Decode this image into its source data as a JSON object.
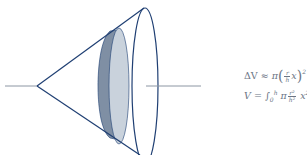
{
  "diagram": {
    "colors": {
      "outline": "#1f3f73",
      "axis": "#8c96a3",
      "disk_front": "#c9d2dc",
      "disk_side": "#7f8fa4",
      "text": "#6b7585"
    },
    "equations": {
      "slice": {
        "delta_v": "ΔV",
        "approx": "≈",
        "pi": "π",
        "lparen": "(",
        "frac_num": "r",
        "frac_den": "h",
        "var": "x",
        "rparen": ")",
        "exp": "2",
        "delta_x": "Δx"
      },
      "integral": {
        "v": "V",
        "eq": "=",
        "integral": "∫",
        "lower": "0",
        "upper": "h",
        "pi": "π",
        "frac_num": "r²",
        "frac_den": "h²",
        "x2": "x",
        "exp": "2",
        "dx": "dx"
      }
    }
  }
}
